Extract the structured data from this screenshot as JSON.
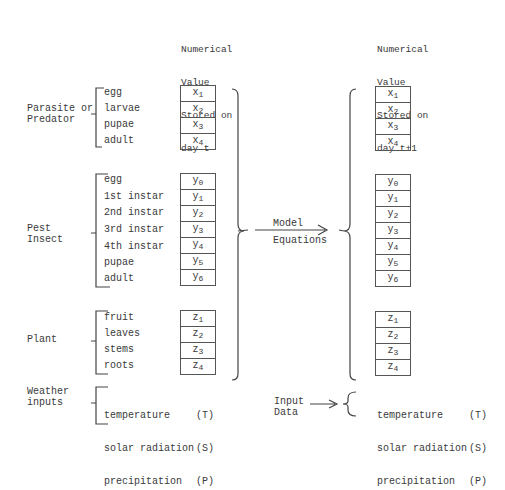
{
  "headers": {
    "left": [
      "Numerical",
      "Value",
      "Stored on",
      "day t"
    ],
    "right": [
      "Numerical",
      "Value",
      "Stored on",
      "day t+1"
    ]
  },
  "groups": [
    {
      "name": "Parasite or\nPredator",
      "stages": [
        "egg",
        "larvae",
        "pupae",
        "adult"
      ],
      "var": "x",
      "subs": [
        "1",
        "2",
        "3",
        "4"
      ]
    },
    {
      "name": "Pest\nInsect",
      "stages": [
        "egg",
        "1st instar",
        "2nd instar",
        "3rd instar",
        "4th instar",
        "pupae",
        "adult"
      ],
      "var": "y",
      "subs": [
        "0",
        "1",
        "2",
        "3",
        "4",
        "5",
        "6"
      ]
    },
    {
      "name": "Plant",
      "stages": [
        "fruit",
        "leaves",
        "stems",
        "roots"
      ],
      "var": "z",
      "subs": [
        "1",
        "2",
        "3",
        "4"
      ]
    }
  ],
  "weather": {
    "name": "Weather\ninputs",
    "items": [
      {
        "label": "temperature",
        "abbr": "(T)"
      },
      {
        "label": "solar radiation",
        "abbr": "(S)"
      },
      {
        "label": "precipitation",
        "abbr": "(P)"
      }
    ]
  },
  "model": {
    "line1": "Model",
    "line2": "Equations"
  },
  "input_data": "Input\nData",
  "colors": {
    "ink": "#3a3a3a",
    "background": "#ffffff"
  }
}
